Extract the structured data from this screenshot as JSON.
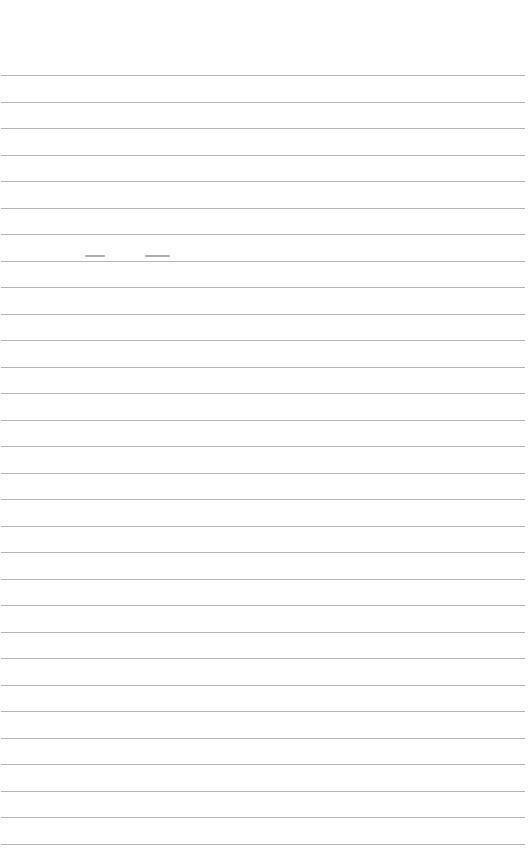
{
  "paper": {
    "type": "lined-paper",
    "background_color": "#ffffff",
    "line_color": "#a9a9a9",
    "line_count": 30,
    "first_line_y": 75,
    "line_spacing": 26.5
  }
}
